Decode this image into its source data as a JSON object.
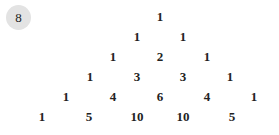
{
  "badge": {
    "label": "8",
    "color": "#e3e3e3"
  },
  "triangle": {
    "rows": [
      [
        "1"
      ],
      [
        "1",
        "1"
      ],
      [
        "1",
        "2",
        "1"
      ],
      [
        "1",
        "3",
        "3",
        "1"
      ],
      [
        "1",
        "4",
        "6",
        "4",
        "1"
      ],
      [
        "1",
        "5",
        "10",
        "10",
        "5"
      ]
    ]
  }
}
